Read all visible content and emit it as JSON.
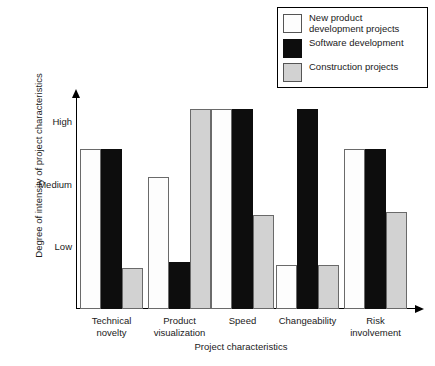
{
  "chart_data": {
    "type": "bar",
    "title": "",
    "xlabel": "Project characteristics",
    "ylabel": "Degree of intensity of project characteristics",
    "categories": [
      "Technical\nnovelty",
      "Product\nvisualization",
      "Speed",
      "Changeability",
      "Risk\ninvolvement"
    ],
    "ytick_labels": [
      "Low",
      "Medium",
      "High"
    ],
    "ytick_values": [
      1,
      2,
      3
    ],
    "ylim": [
      0,
      3.4
    ],
    "grid": false,
    "legend_position": "top-right",
    "series": [
      {
        "name": "New product\ndevelopment projects",
        "color": "#fdfdfd",
        "values": [
          2.55,
          2.1,
          3.2,
          0.7,
          2.55
        ]
      },
      {
        "name": "Software development",
        "color": "#0d0d0d",
        "values": [
          2.55,
          0.75,
          3.2,
          3.2,
          2.55
        ]
      },
      {
        "name": "Construction projects",
        "color": "#d2d2d2",
        "values": [
          0.65,
          3.2,
          1.5,
          0.7,
          1.55
        ]
      }
    ]
  },
  "legend": {
    "items": [
      {
        "label": "New product\ndevelopment projects",
        "swatch": "white-swatch"
      },
      {
        "label": "Software development",
        "swatch": "black-swatch"
      },
      {
        "label": "Construction projects",
        "swatch": "gray-swatch"
      }
    ]
  },
  "axes": {
    "y_title": "Degree of intensity of project characteristics",
    "x_title": "Project characteristics",
    "y_ticks": [
      "High",
      "Medium",
      "Low"
    ],
    "x_ticks": [
      "Technical\nnovelty",
      "Product\nvisualization",
      "Speed",
      "Changeability",
      "Risk\ninvolvement"
    ]
  }
}
